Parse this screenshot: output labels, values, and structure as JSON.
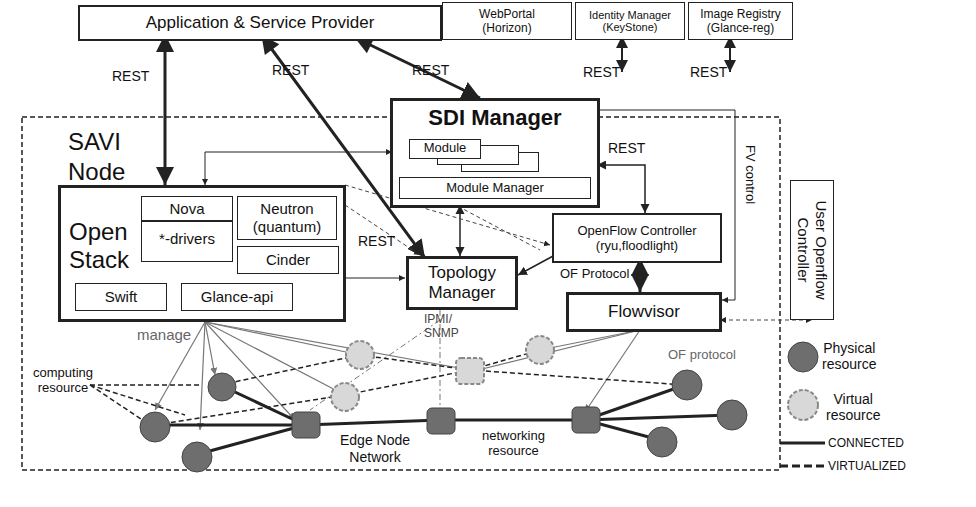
{
  "top": {
    "asp": "Application & Service Provider",
    "webportal": [
      "WebPortal",
      "(Horizon)"
    ],
    "identity": [
      "Identity Manager",
      "(KeyStone)"
    ],
    "registry": [
      "Image Registry",
      "(Glance-reg)"
    ],
    "rest_labels": [
      "REST",
      "REST",
      "REST",
      "REST",
      "REST"
    ]
  },
  "node": {
    "title": [
      "SAVI",
      "Node"
    ],
    "sdi": {
      "title": "SDI Manager",
      "module": "Module",
      "module_manager": "Module Manager",
      "rest": "REST"
    },
    "openstack": {
      "title": [
        "Open",
        "Stack"
      ],
      "nova": "Nova",
      "drivers": "*-drivers",
      "neutron": [
        "Neutron",
        "(quantum)"
      ],
      "cinder": "Cinder",
      "swift": "Swift",
      "glance_api": "Glance-api"
    },
    "rest_mid": "REST",
    "of_controller": [
      "OpenFlow Controller",
      "(ryu,floodlight)"
    ],
    "of_protocol": "OF Protocol",
    "topology": [
      "Topology",
      "Manager"
    ],
    "flowvisor": "Flowvisor",
    "fv_control": "FV control",
    "manage": "manage",
    "ipmi": [
      "IPMI/",
      "SNMP"
    ],
    "computing": [
      "computing",
      "resource"
    ],
    "edge": [
      "Edge Node",
      "Network"
    ],
    "networking": [
      "networking",
      "resource"
    ],
    "of_protocol_lower": "OF protocol"
  },
  "user_of_controller": [
    "User Openflow",
    "Controller"
  ],
  "legend": {
    "physical": [
      "Physical",
      "resource"
    ],
    "virtual": [
      "Virtual",
      "resource"
    ],
    "connected": "CONNECTED",
    "virtualized": "VIRTUALIZED"
  },
  "colors": {
    "node_fill": "#6e6e6e",
    "virtual_fill": "#d8d8d8",
    "virtual_border": "#888888",
    "line": "#222222",
    "arrow_gray": "#777777"
  }
}
